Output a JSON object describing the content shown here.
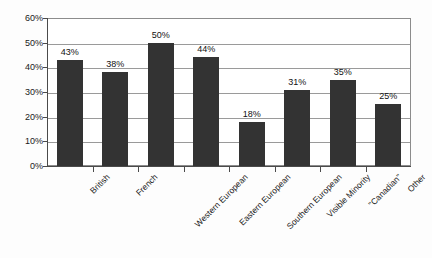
{
  "chart_data": {
    "type": "bar",
    "title": "",
    "xlabel": "",
    "ylabel": "",
    "categories": [
      "British",
      "French",
      "Western European",
      "Eastern European",
      "Southern European",
      "Visible Minority",
      "\"Canadian\"",
      "Other"
    ],
    "values": [
      43,
      38,
      50,
      44,
      18,
      31,
      35,
      25
    ],
    "value_labels": [
      "43%",
      "38%",
      "50%",
      "44%",
      "18%",
      "31%",
      "35%",
      "25%"
    ],
    "ylim": [
      0,
      60
    ],
    "ytick_values": [
      0,
      10,
      20,
      30,
      40,
      50,
      60
    ],
    "ytick_labels": [
      "0%",
      "10%",
      "20%",
      "30%",
      "40%",
      "50%",
      "60%"
    ],
    "grid": true,
    "grid_axis": "y",
    "legend": false,
    "legend_position": "none",
    "bar_color": "#333333",
    "grid_color": "#9a9a9a",
    "axis_color": "#4a4a4a",
    "plot_background": "#ffffff",
    "figure_background": "#fdfdfd",
    "label_rotation_deg": -45,
    "value_label_position": "above-bar"
  }
}
